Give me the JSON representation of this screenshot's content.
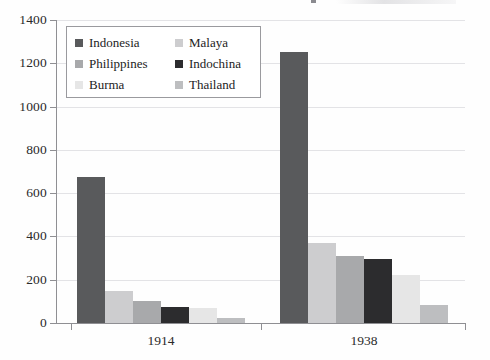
{
  "chart_data": {
    "type": "bar",
    "title": "",
    "subtitle": "",
    "xlabel": "",
    "ylabel": "",
    "categories": [
      "1914",
      "1938"
    ],
    "ylim": [
      0,
      1400
    ],
    "yticks": [
      0,
      200,
      400,
      600,
      800,
      1000,
      1200,
      1400
    ],
    "ytick_labels": [
      "0",
      "200",
      "400",
      "600",
      "800",
      "1000",
      "1200",
      "1400"
    ],
    "grid": "horizontal",
    "legend_position": "upper-left-inside",
    "legend_columns": 2,
    "series": [
      {
        "name": "Indonesia",
        "color": "#595a5c",
        "values": [
          675,
          1250
        ]
      },
      {
        "name": "Malaya",
        "color": "#cdcdcf",
        "values": [
          150,
          370
        ]
      },
      {
        "name": "Philippines",
        "color": "#a8a9ab",
        "values": [
          100,
          310
        ]
      },
      {
        "name": "Indochina",
        "color": "#2c2c2e",
        "values": [
          73,
          295
        ]
      },
      {
        "name": "Burma",
        "color": "#e6e6e6",
        "values": [
          70,
          220
        ]
      },
      {
        "name": "Thailand",
        "color": "#bdbec0",
        "values": [
          25,
          85
        ]
      }
    ]
  },
  "legend": {
    "entries": [
      {
        "label": "Indonesia",
        "swatch": "#595a5c"
      },
      {
        "label": "Malaya",
        "swatch": "#cdcdcf"
      },
      {
        "label": "Philippines",
        "swatch": "#a8a9ab"
      },
      {
        "label": "Indochina",
        "swatch": "#2c2c2e"
      },
      {
        "label": "Burma",
        "swatch": "#e6e6e6"
      },
      {
        "label": "Thailand",
        "swatch": "#bdbec0"
      }
    ]
  },
  "axes": {
    "y_tick_labels": [
      "1400",
      "1200",
      "1000",
      "800",
      "600",
      "400",
      "200",
      "0"
    ],
    "x_tick_labels": [
      "1914",
      "1938"
    ]
  },
  "style": {
    "grid_color": "#e3e3e6",
    "axis_color": "#8f8f93",
    "text_color": "#2a2a2a",
    "background": "#fefefe"
  }
}
